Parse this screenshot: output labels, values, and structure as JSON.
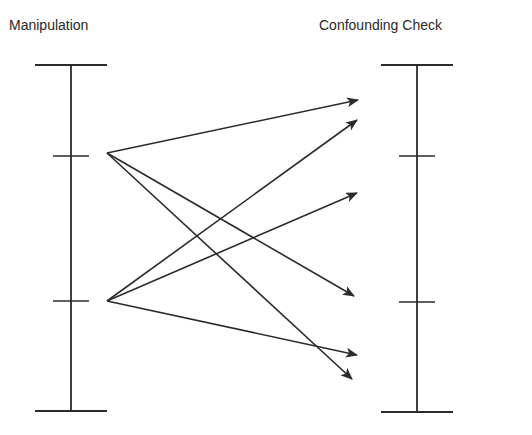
{
  "diagram": {
    "left_axis": {
      "label": "Manipulation",
      "x": 71,
      "y_top": 65,
      "y_bottom": 411,
      "cap_half_width": 36,
      "ticks": [
        156,
        301
      ],
      "tick_half_width": 18
    },
    "right_axis": {
      "label": "Confounding Check",
      "x": 417,
      "y_top": 65,
      "y_bottom": 412,
      "cap_half_width": 36,
      "ticks": [
        156,
        302
      ],
      "tick_half_width": 18
    },
    "arrows": [
      {
        "from": [
          107,
          153
        ],
        "to": [
          358,
          100
        ]
      },
      {
        "from": [
          107,
          153
        ],
        "to": [
          354,
          296
        ]
      },
      {
        "from": [
          107,
          153
        ],
        "to": [
          352,
          379
        ]
      },
      {
        "from": [
          107,
          301
        ],
        "to": [
          357,
          120
        ]
      },
      {
        "from": [
          107,
          301
        ],
        "to": [
          357,
          193
        ]
      },
      {
        "from": [
          107,
          301
        ],
        "to": [
          357,
          355
        ]
      }
    ],
    "line_color": "#2b2b2b"
  }
}
